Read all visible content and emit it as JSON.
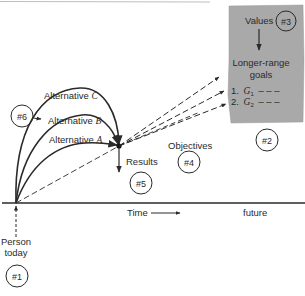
{
  "diagram": {
    "type": "goal-setting flow diagram",
    "colors": {
      "ink": "#2a2a2a",
      "box_fill": "#a9a9a9",
      "background": "#ffffff"
    },
    "box": {
      "values_label": "Values",
      "marker": "#3",
      "goals_title_line1": "Longer-range",
      "goals_title_line2": "goals",
      "goal1_prefix": "1.",
      "goal1_var": "G",
      "goal1_sub": "1",
      "goal1_dashes": "– – –",
      "goal2_prefix": "2.",
      "goal2_var": "G",
      "goal2_sub": "2",
      "goal2_dashes": "– – –"
    },
    "alternatives": [
      {
        "label": "Alternative",
        "letter": "C"
      },
      {
        "label": "Alternative",
        "letter": "B"
      },
      {
        "label": "Alternative",
        "letter": "A"
      }
    ],
    "labels": {
      "results": "Results",
      "objectives": "Objectives",
      "time": "Time",
      "future": "future",
      "person_line1": "Person",
      "person_line2": "today"
    },
    "markers": {
      "m1": "#1",
      "m2": "#2",
      "m4": "#4",
      "m5": "#5",
      "m6": "#6"
    }
  }
}
